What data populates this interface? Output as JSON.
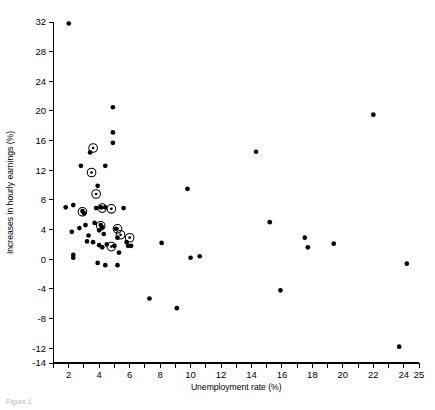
{
  "figure": {
    "background_color": "#ffffff",
    "foreground_color": "#000000",
    "partial_caption": "Figure 1"
  },
  "chart_data": {
    "type": "scatter",
    "title": "",
    "xlabel": "Unemployment rate (%)",
    "ylabel": "Increases in hourly earnings (%)",
    "xlim": [
      1,
      25
    ],
    "ylim": [
      -14,
      32
    ],
    "xticks": [
      1,
      2,
      3,
      4,
      5,
      6,
      7,
      8,
      9,
      10,
      11,
      12,
      13,
      14,
      15,
      16,
      17,
      18,
      19,
      20,
      21,
      22,
      23,
      24,
      25
    ],
    "xtick_labels": [
      "",
      "2",
      "",
      "4",
      "",
      "6",
      "",
      "8",
      "",
      "10",
      "",
      "12",
      "",
      "14",
      "",
      "16",
      "",
      "18",
      "",
      "20",
      "",
      "22",
      "",
      "24",
      "25"
    ],
    "yticks": [
      -14,
      -12,
      -8,
      -4,
      0,
      4,
      8,
      12,
      16,
      20,
      24,
      28,
      32
    ],
    "ytick_labels": [
      "-14",
      "-12",
      "-8",
      "-4",
      "0",
      "4",
      "8",
      "12",
      "16",
      "20",
      "24",
      "28",
      "32"
    ],
    "grid": false,
    "legend": "none",
    "spines": [
      "left",
      "bottom"
    ],
    "series": [
      {
        "name": "observations",
        "marker": "filled-circle",
        "color": "#000000",
        "points": [
          [
            2.0,
            31.8
          ],
          [
            2.8,
            12.6
          ],
          [
            3.4,
            14.4
          ],
          [
            4.9,
            20.5
          ],
          [
            4.9,
            17.1
          ],
          [
            4.9,
            15.7
          ],
          [
            4.4,
            12.6
          ],
          [
            3.9,
            9.9
          ],
          [
            1.8,
            7.0
          ],
          [
            2.3,
            7.3
          ],
          [
            2.2,
            3.7
          ],
          [
            2.3,
            0.6
          ],
          [
            2.3,
            0.2
          ],
          [
            2.9,
            6.5
          ],
          [
            3.0,
            6.2
          ],
          [
            3.1,
            4.6
          ],
          [
            2.7,
            4.2
          ],
          [
            3.3,
            3.2
          ],
          [
            3.2,
            2.4
          ],
          [
            3.6,
            2.3
          ],
          [
            3.7,
            4.9
          ],
          [
            3.8,
            6.9
          ],
          [
            4.1,
            7.0
          ],
          [
            4.4,
            7.0
          ],
          [
            4.1,
            4.6
          ],
          [
            4.2,
            4.3
          ],
          [
            4.0,
            3.9
          ],
          [
            4.3,
            3.4
          ],
          [
            4.0,
            1.9
          ],
          [
            4.2,
            1.6
          ],
          [
            4.5,
            2.0
          ],
          [
            3.9,
            -0.5
          ],
          [
            4.4,
            -0.8
          ],
          [
            5.1,
            4.1
          ],
          [
            5.2,
            2.9
          ],
          [
            5.0,
            1.8
          ],
          [
            5.3,
            0.9
          ],
          [
            5.2,
            -0.8
          ],
          [
            5.6,
            6.9
          ],
          [
            5.8,
            2.3
          ],
          [
            5.9,
            1.8
          ],
          [
            6.1,
            1.8
          ],
          [
            7.3,
            -5.3
          ],
          [
            8.1,
            2.2
          ],
          [
            9.1,
            -6.6
          ],
          [
            9.8,
            9.5
          ],
          [
            10.0,
            0.2
          ],
          [
            10.6,
            0.4
          ],
          [
            14.3,
            14.5
          ],
          [
            15.2,
            5.0
          ],
          [
            15.9,
            -4.2
          ],
          [
            17.5,
            2.9
          ],
          [
            17.7,
            1.6
          ],
          [
            19.4,
            2.1
          ],
          [
            22.0,
            19.5
          ],
          [
            23.7,
            -11.8
          ],
          [
            24.2,
            -0.6
          ]
        ]
      },
      {
        "name": "highlighted-observations",
        "marker": "circled-dot",
        "color": "#000000",
        "points": [
          [
            3.6,
            15.0
          ],
          [
            3.5,
            11.7
          ],
          [
            3.8,
            8.8
          ],
          [
            2.9,
            6.4
          ],
          [
            4.2,
            6.9
          ],
          [
            4.1,
            4.5
          ],
          [
            4.8,
            6.8
          ],
          [
            5.2,
            4.1
          ],
          [
            5.4,
            3.3
          ],
          [
            6.0,
            2.9
          ],
          [
            4.8,
            1.7
          ]
        ]
      }
    ]
  }
}
